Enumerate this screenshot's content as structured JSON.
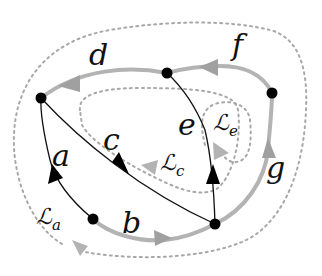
{
  "diagram": {
    "type": "directed-graph-with-loops",
    "colors": {
      "black_edge": "#111111",
      "gray_edge": "#b3b3b3",
      "dotted_loop": "#a8a8a8",
      "node": "#000000",
      "background": "#ffffff"
    },
    "nodes": [
      {
        "id": "n_topleft",
        "x": 41,
        "y": 98
      },
      {
        "id": "n_top",
        "x": 167,
        "y": 73
      },
      {
        "id": "n_right",
        "x": 272,
        "y": 93
      },
      {
        "id": "n_bottomleft",
        "x": 93,
        "y": 219
      },
      {
        "id": "n_bottomright",
        "x": 215,
        "y": 224
      }
    ],
    "edges": [
      {
        "label": "a",
        "from": "n_bottomleft",
        "to": "n_topleft",
        "style": "black"
      },
      {
        "label": "b",
        "from": "n_bottomleft",
        "to": "n_bottomright",
        "style": "gray"
      },
      {
        "label": "c",
        "from": "n_topleft",
        "to": "n_bottomright",
        "style": "black"
      },
      {
        "label": "d",
        "from": "n_top",
        "to": "n_topleft",
        "style": "gray"
      },
      {
        "label": "e",
        "from": "n_bottomright",
        "to": "n_top",
        "style": "black"
      },
      {
        "label": "f",
        "from": "n_right",
        "to": "n_top",
        "style": "gray"
      },
      {
        "label": "g",
        "from": "n_bottomright",
        "to": "n_right",
        "style": "gray"
      }
    ],
    "labels": {
      "a": "a",
      "b": "b",
      "c": "c",
      "d": "d",
      "e": "e",
      "f": "f",
      "g": "g"
    },
    "loops": [
      {
        "symbol": "ℒ",
        "subscript": "a"
      },
      {
        "symbol": "ℒ",
        "subscript": "c"
      },
      {
        "symbol": "ℒ",
        "subscript": "e"
      }
    ]
  }
}
